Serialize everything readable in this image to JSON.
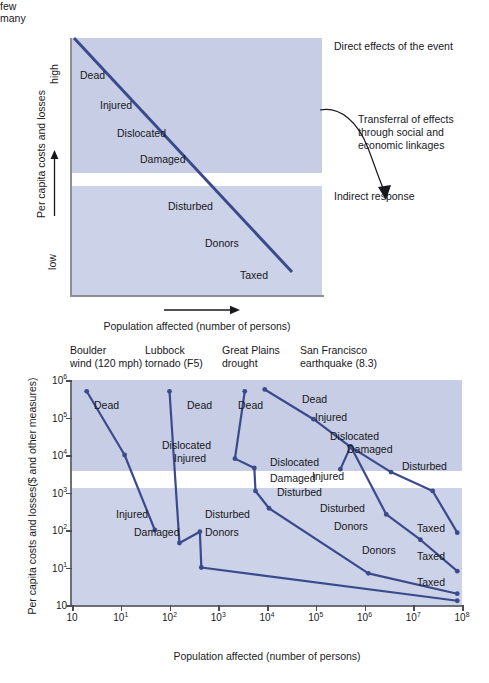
{
  "figure": {
    "colors": {
      "band_high": "#c6cde4",
      "band_low": "#ccd2e7",
      "line": "#3b4a8c",
      "axis": "#6e6e78",
      "text": "#17171c"
    }
  },
  "panel_a": {
    "y_axis": {
      "title": "Per capita costs and losses",
      "top_label": "high",
      "bottom_label": "low"
    },
    "x_axis": {
      "title": "Population affected (number of persons)",
      "left_label": "few",
      "right_label": "many"
    },
    "band_labels": [
      {
        "text": "Dead",
        "x": 8,
        "y": 32
      },
      {
        "text": "Injured",
        "x": 28,
        "y": 62
      },
      {
        "text": "Dislocated",
        "x": 45,
        "y": 90
      },
      {
        "text": "Damaged",
        "x": 68,
        "y": 116
      },
      {
        "text": "Disturbed",
        "x": 96,
        "y": 163
      },
      {
        "text": "Donors",
        "x": 133,
        "y": 200
      },
      {
        "text": "Taxed",
        "x": 168,
        "y": 232
      }
    ],
    "annotations": {
      "direct": "Direct effects of the event",
      "transferral_line1": "Transferral of effects",
      "transferral_line2": "through social and",
      "transferral_line3": "economic linkages",
      "indirect": "Indirect response"
    }
  },
  "chart_data": {
    "type": "line",
    "xlabel": "Population affected (number of persons)",
    "ylabel": "Per capita costs and losses($ and other measures)",
    "xscale": "log",
    "yscale": "log",
    "xlim": [
      1,
      100000000
    ],
    "ylim": [
      1,
      1000000
    ],
    "grid": false,
    "legend": "column headers above plot",
    "x_ticks": [
      {
        "label": "10",
        "exp": "",
        "value": 1
      },
      {
        "label": "10",
        "exp": "1",
        "value": 10
      },
      {
        "label": "10",
        "exp": "2",
        "value": 100
      },
      {
        "label": "10",
        "exp": "3",
        "value": 1000
      },
      {
        "label": "10",
        "exp": "4",
        "value": 10000
      },
      {
        "label": "10",
        "exp": "5",
        "value": 100000
      },
      {
        "label": "10",
        "exp": "6",
        "value": 1000000
      },
      {
        "label": "10",
        "exp": "7",
        "value": 10000000
      },
      {
        "label": "10",
        "exp": "8",
        "value": 100000000
      }
    ],
    "y_ticks": [
      {
        "label": "10",
        "exp": "6",
        "value": 1000000
      },
      {
        "label": "10",
        "exp": "5",
        "value": 100000
      },
      {
        "label": "10",
        "exp": "4",
        "value": 10000
      },
      {
        "label": "10",
        "exp": "3",
        "value": 1000
      },
      {
        "label": "10",
        "exp": "2",
        "value": 100
      },
      {
        "label": "10",
        "exp": "1",
        "value": 10
      },
      {
        "label": "10",
        "exp": "",
        "value": 1
      }
    ],
    "event_headers": [
      {
        "line1": "Boulder",
        "line2": "wind (120 mph)"
      },
      {
        "line1": "Lubbock",
        "line2": "tornado (F5)"
      },
      {
        "line1": "Great Plains",
        "line2": "drought"
      },
      {
        "line1": "San Francisco",
        "line2": "earthquake (8.3)"
      }
    ],
    "series": [
      {
        "name": "Boulder wind (120 mph)",
        "points": [
          {
            "stage": "Dead",
            "x": 2,
            "y": 500000
          },
          {
            "stage": "Dislocated",
            "x": 12,
            "y": 10000
          },
          {
            "stage": "Injured",
            "x": 50,
            "y": 100
          }
        ]
      },
      {
        "name": "Lubbock tornado (F5)",
        "points": [
          {
            "stage": "Dead",
            "x": 100,
            "y": 500000
          },
          {
            "stage": "Damaged",
            "x": 160,
            "y": 45
          },
          {
            "stage": "Disturbed",
            "x": 420,
            "y": 90
          },
          {
            "stage": "Donors",
            "x": 450,
            "y": 10
          },
          {
            "stage": "Taxed",
            "x": 80000000,
            "y": 1.3
          }
        ]
      },
      {
        "name": "Great Plains drought",
        "points": [
          {
            "stage": "Dead",
            "x": 3500,
            "y": 500000
          },
          {
            "stage": "Injured",
            "x": 2200,
            "y": 8000
          },
          {
            "stage": "Dislocated",
            "x": 5500,
            "y": 4500
          },
          {
            "stage": "Damaged",
            "x": 5800,
            "y": 1100
          },
          {
            "stage": "Disturbed",
            "x": 11000,
            "y": 380
          },
          {
            "stage": "Donors",
            "x": 1200000,
            "y": 7
          },
          {
            "stage": "Taxed",
            "x": 80000000,
            "y": 2
          }
        ]
      },
      {
        "name": "San Francisco earthquake (8.3) — direct chain",
        "points": [
          {
            "stage": "Dead",
            "x": 9000,
            "y": 560000
          },
          {
            "stage": "Injured",
            "x": 90000,
            "y": 90000
          },
          {
            "stage": "Dislocated",
            "x": 500000,
            "y": 17000
          },
          {
            "stage": "Damaged",
            "x": 3500000,
            "y": 3500
          },
          {
            "stage": "Disturbed",
            "x": 25000000,
            "y": 1100
          },
          {
            "stage": "Taxed",
            "x": 80000000,
            "y": 85
          }
        ]
      },
      {
        "name": "San Francisco earthquake (8.3) — indirect chain",
        "points": [
          {
            "stage": "Injured",
            "x": 320000,
            "y": 4200
          },
          {
            "stage": "Dislocated",
            "x": 520000,
            "y": 17000
          },
          {
            "stage": "Disturbed",
            "x": 2800000,
            "y": 260
          },
          {
            "stage": "Donors",
            "x": 14000000,
            "y": 55
          },
          {
            "stage": "Taxed",
            "x": 80000000,
            "y": 8
          }
        ]
      }
    ],
    "point_labels": [
      {
        "text": "Dead",
        "x": 22,
        "y": 19
      },
      {
        "text": "Dislocated",
        "x": 90,
        "y": 59
      },
      {
        "text": "Injured",
        "x": 44,
        "y": 128
      },
      {
        "text": "Damaged",
        "x": 62,
        "y": 146
      },
      {
        "text": "Dead",
        "x": 115,
        "y": 19
      },
      {
        "text": "Injured",
        "x": 102,
        "y": 72
      },
      {
        "text": "Disturbed",
        "x": 133,
        "y": 128
      },
      {
        "text": "Donors",
        "x": 133,
        "y": 146
      },
      {
        "text": "Dead",
        "x": 166,
        "y": 19
      },
      {
        "text": "Dislocated",
        "x": 198,
        "y": 76
      },
      {
        "text": "Damaged",
        "x": 198,
        "y": 92
      },
      {
        "text": "Disturbed",
        "x": 205,
        "y": 106
      },
      {
        "text": "Dead",
        "x": 230,
        "y": 13
      },
      {
        "text": "Injured",
        "x": 243,
        "y": 31
      },
      {
        "text": "Dislocated",
        "x": 258,
        "y": 50
      },
      {
        "text": "Damaged",
        "x": 275,
        "y": 63
      },
      {
        "text": "Injured",
        "x": 240,
        "y": 90
      },
      {
        "text": "Disturbed",
        "x": 330,
        "y": 80
      },
      {
        "text": "Disturbed",
        "x": 248,
        "y": 122
      },
      {
        "text": "Donors",
        "x": 262,
        "y": 140
      },
      {
        "text": "Donors",
        "x": 290,
        "y": 164
      },
      {
        "text": "Taxed",
        "x": 345,
        "y": 142
      },
      {
        "text": "Taxed",
        "x": 345,
        "y": 170
      },
      {
        "text": "Taxed",
        "x": 345,
        "y": 196
      }
    ]
  }
}
